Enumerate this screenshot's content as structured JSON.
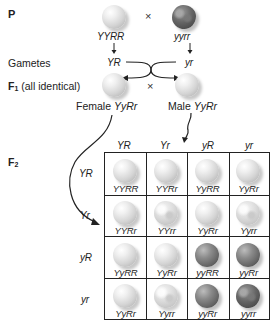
{
  "generations": {
    "parental": {
      "label": "P",
      "cross_symbol": "×",
      "parents": [
        {
          "genotype": "YYRR",
          "phenotype": "round-yellow"
        },
        {
          "genotype": "yyrr",
          "phenotype": "wrinkled-green"
        }
      ]
    },
    "gametes": {
      "label": "Gametes",
      "items": [
        "YR",
        "yr"
      ]
    },
    "f1": {
      "label_main": "F",
      "label_sub": "1",
      "label_note": "(all identical)",
      "cross_symbol": "×",
      "female": {
        "prefix": "Female",
        "genotype": "YyRr",
        "phenotype": "round-yellow"
      },
      "male": {
        "prefix": "Male",
        "genotype": "YyRr",
        "phenotype": "round-yellow"
      }
    },
    "f2": {
      "label_main": "F",
      "label_sub": "2",
      "column_headers": [
        "YR",
        "Yr",
        "yR",
        "yr"
      ],
      "row_headers": [
        "YR",
        "Yr",
        "yR",
        "yr"
      ],
      "cells": [
        [
          {
            "genotype": "YYRR",
            "phenotype": "round-yellow"
          },
          {
            "genotype": "YYRr",
            "phenotype": "round-yellow"
          },
          {
            "genotype": "YyRR",
            "phenotype": "round-yellow"
          },
          {
            "genotype": "YyRr",
            "phenotype": "round-yellow"
          }
        ],
        [
          {
            "genotype": "YYRr",
            "phenotype": "round-yellow"
          },
          {
            "genotype": "YYrr",
            "phenotype": "wrinkled-yellow"
          },
          {
            "genotype": "YyRr",
            "phenotype": "round-yellow"
          },
          {
            "genotype": "Yyrr",
            "phenotype": "wrinkled-yellow"
          }
        ],
        [
          {
            "genotype": "YyRR",
            "phenotype": "round-yellow"
          },
          {
            "genotype": "YyRr",
            "phenotype": "round-yellow"
          },
          {
            "genotype": "yyRR",
            "phenotype": "round-green"
          },
          {
            "genotype": "yyRr",
            "phenotype": "round-green"
          }
        ],
        [
          {
            "genotype": "YyRr",
            "phenotype": "round-yellow"
          },
          {
            "genotype": "Yyrr",
            "phenotype": "wrinkled-yellow"
          },
          {
            "genotype": "yyRr",
            "phenotype": "round-green"
          },
          {
            "genotype": "yyrr",
            "phenotype": "wrinkled-green"
          }
        ]
      ]
    }
  },
  "colors": {
    "line": "#222222",
    "text": "#222222",
    "background": "#ffffff"
  }
}
